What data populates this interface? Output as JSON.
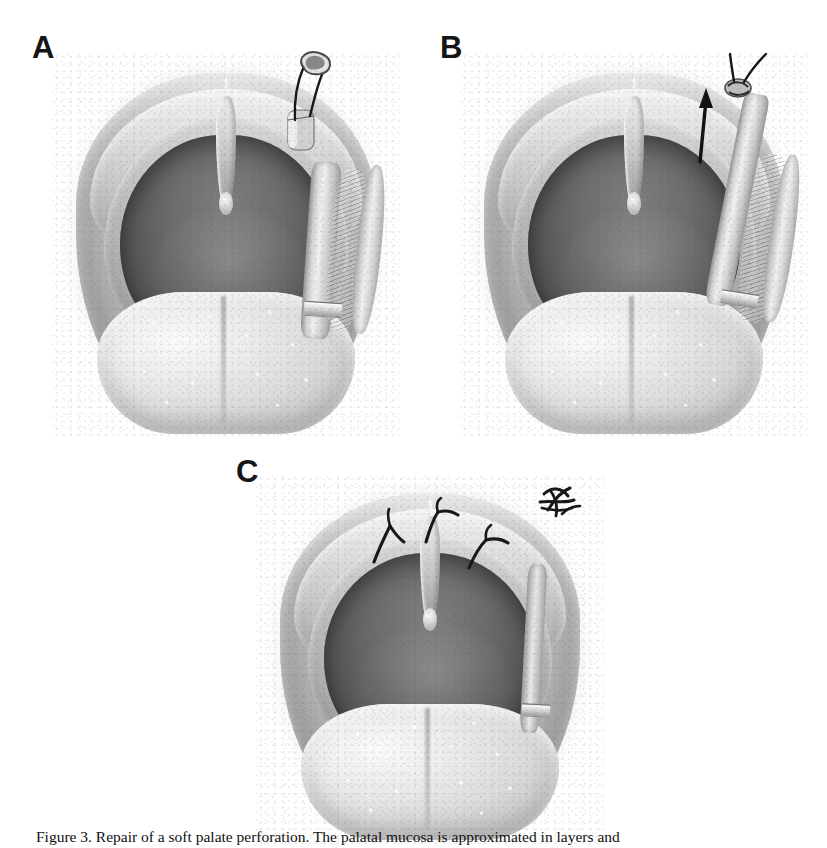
{
  "figure": {
    "domain": "medical-surgical-illustration",
    "style": "grayscale airbrush/stipple anatomical drawing",
    "background_color": "#ffffff",
    "ink_color": "#151515",
    "panel_count": 3,
    "caption": "Figure 3. Repair of a soft palate perforation. The palatal mucosa is approximated in layers and"
  },
  "panels": [
    {
      "label": "A",
      "name": "panel-a",
      "description": "Intraoral view of the soft palate and oropharynx with a tubular pedicled flap elevated along the right tonsillar pillar; a curved suture needle with two black suture strands is passed through the free end of the flap.",
      "elements": {
        "needle": "curved-surgical-needle",
        "suture_strands": 2,
        "suture_color": "#17171a",
        "flap": "tubed-pedicled-flap",
        "arrow": false
      }
    },
    {
      "label": "B",
      "name": "panel-b",
      "description": "The suture strands are tightened and the flap is advanced superiorly; a solid black arrow indicates the direction of traction along the flap.",
      "elements": {
        "needle": "none",
        "suture_strands": 2,
        "suture_color": "#17171a",
        "flap": "tubed-pedicled-flap-advanced",
        "arrow": true,
        "arrow_direction": "up",
        "knot": "suture-knot-at-flap-tip"
      }
    },
    {
      "label": "C",
      "name": "panel-c",
      "description": "Completed repair: three interrupted sutures are tied along the palatal margin with short trimmed tails; the excess cut suture material is shown discarded at the upper right.",
      "elements": {
        "needle": "none",
        "tied_sutures": 3,
        "suture_color": "#17171a",
        "flap": "inset-flap",
        "arrow": false,
        "discarded_suture_bundle": true
      }
    }
  ],
  "anatomy": {
    "structures": [
      "soft palate",
      "uvula",
      "anterior tonsillar pillar",
      "posterior tonsillar pillar",
      "oropharynx",
      "dorsum of tongue"
    ],
    "tones": {
      "pharynx_dark": "#5d5d5d",
      "palate_mid": "#c2c2c2",
      "tongue_light": "#ededed",
      "highlight": "#fafafa",
      "shadow": "#8f8f8f"
    }
  }
}
